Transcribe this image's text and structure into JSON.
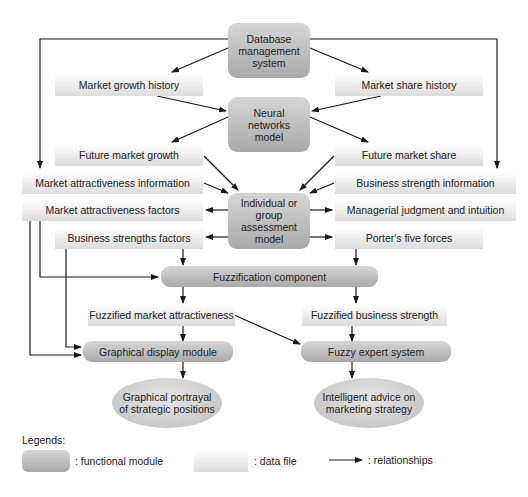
{
  "diagram": {
    "modules": {
      "database": "Database management system",
      "neural": "Neural networks model",
      "assessment": "Individual or group assessment model",
      "fuzzification": "Fuzzification component",
      "graphical_display": "Graphical display module",
      "fuzzy_expert": "Fuzzy expert system"
    },
    "database_lines": [
      "Database",
      "management",
      "system"
    ],
    "neural_lines": [
      "Neural",
      "networks",
      "model"
    ],
    "assessment_lines": [
      "Individual or",
      "group",
      "assessment",
      "model"
    ],
    "data_files": {
      "market_growth_history": "Market growth history",
      "market_share_history": "Market share history",
      "future_market_growth": "Future market growth",
      "future_market_share": "Future market share",
      "market_attractiveness_information": "Market attractiveness information",
      "business_strength_information": "Business strength information",
      "market_attractiveness_factors": "Market attractiveness factors",
      "managerial_judgment": "Managerial judgment and intuition",
      "business_strengths_factors": "Business strengths factors",
      "porters_five_forces": "Porter's five forces",
      "fuzzified_market_attractiveness": "Fuzzified market attractiveness",
      "fuzzified_business_strength": "Fuzzified business strength"
    },
    "outputs": {
      "graphical_portrayal": [
        "Graphical portrayal",
        "of strategic positions"
      ],
      "intelligent_advice": [
        "Intelligent advice on",
        "marketing strategy"
      ]
    }
  },
  "legend": {
    "title": "Legends:",
    "functional_module": ": functional module",
    "data_file": ": data file",
    "relationships": ": relationships"
  },
  "colors": {
    "module": "#b5b5b5",
    "data_file": "#e8e8e8",
    "arrow": "#1a1a1a"
  }
}
